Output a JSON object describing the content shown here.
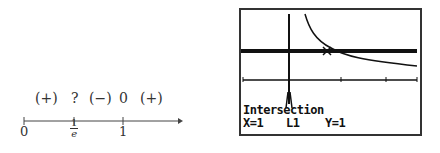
{
  "number_line": {
    "signs": [
      {
        "text": "(+)",
        "x": 14
      },
      {
        "text": "?",
        "x": 71
      },
      {
        "text": "(−)",
        "x": 89
      },
      {
        "text": "0",
        "x": 119
      },
      {
        "text": "(+)",
        "x": 140
      }
    ],
    "ticks": [
      {
        "label": "0",
        "x": 24
      },
      {
        "label": "1",
        "x": 123
      }
    ],
    "fraction": {
      "numerator": "1",
      "denominator": "e"
    }
  },
  "calculator": {
    "label": "Intersection",
    "x_value": "X=1",
    "y_value": "Y=1",
    "cursor": "L1"
  }
}
